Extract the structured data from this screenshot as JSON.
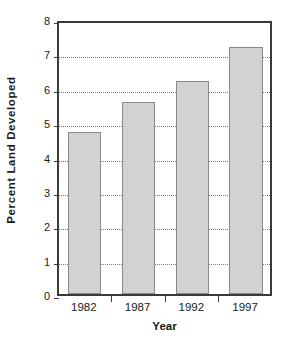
{
  "chart_data": {
    "type": "bar",
    "title": "",
    "subtitle": "",
    "xlabel": "Year",
    "ylabel": "Percent  Land  Developed",
    "categories": [
      "1982",
      "1987",
      "1992",
      "1997"
    ],
    "values": [
      4.7,
      5.6,
      6.2,
      7.2
    ],
    "series": [
      {
        "name": "Percent Land Developed",
        "values": [
          4.7,
          5.6,
          6.2,
          7.2
        ]
      }
    ],
    "ylim": [
      0,
      8
    ],
    "ytick_labels": [
      "0",
      "1",
      "2",
      "3",
      "4",
      "5",
      "6",
      "7",
      "8"
    ],
    "ytick_values": [
      0,
      1,
      2,
      3,
      4,
      5,
      6,
      7,
      8
    ],
    "grid": "horizontal-dotted",
    "legend": "none",
    "colors": {
      "bar_fill": "#d2d2d2",
      "bar_stroke": "#8a8a8a",
      "axis": "#3a3a3a",
      "gridline": "#7d7d7d",
      "text": "#1a1a1a",
      "background": "#ffffff"
    }
  }
}
